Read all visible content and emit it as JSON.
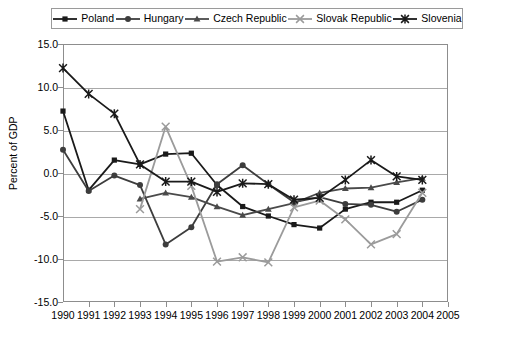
{
  "chart_data": {
    "type": "line",
    "title": "",
    "subtitle": "",
    "xlabel": "",
    "ylabel": "Percent of GDP",
    "x": [
      1990,
      1991,
      1992,
      1993,
      1994,
      1995,
      1996,
      1997,
      1998,
      1999,
      2000,
      2001,
      2002,
      2003,
      2004
    ],
    "xtick_labels": [
      "1990",
      "1991",
      "1992",
      "1993",
      "1994",
      "1995",
      "1996",
      "1997",
      "1998",
      "1999",
      "2000",
      "2001",
      "2002",
      "2003",
      "2004",
      "2005"
    ],
    "xlim": [
      1990,
      2005
    ],
    "ylim": [
      -15.0,
      15.0
    ],
    "ytick_labels": [
      "15.0",
      "10.0",
      "5.0",
      "0.0",
      "-5.0",
      "-10.0",
      "-15.0"
    ],
    "ytick_values": [
      15.0,
      10.0,
      5.0,
      0.0,
      -5.0,
      -10.0,
      -15.0
    ],
    "grid": true,
    "legend_position": "top",
    "series": [
      {
        "name": "Poland",
        "marker": "square",
        "color": "#1a1a1a",
        "values": [
          7.2,
          -2.0,
          1.5,
          1.0,
          2.2,
          2.3,
          -1.4,
          -3.9,
          -5.0,
          -6.0,
          -6.4,
          -4.2,
          -3.4,
          -3.4,
          -2.0
        ]
      },
      {
        "name": "Hungary",
        "marker": "circle",
        "color": "#3d3d3d",
        "values": [
          2.7,
          -2.1,
          -0.3,
          -1.4,
          -8.3,
          -6.3,
          -1.3,
          0.9,
          -1.3,
          -3.4,
          -2.8,
          -3.6,
          -3.7,
          -4.5,
          -3.1
        ]
      },
      {
        "name": "Czech Republic",
        "marker": "triangle",
        "color": "#4a4a4a",
        "values": [
          null,
          null,
          null,
          -3.0,
          -2.3,
          -2.8,
          -3.9,
          -4.9,
          -4.2,
          -3.5,
          -2.3,
          -1.8,
          -1.7,
          -1.1,
          -0.6
        ]
      },
      {
        "name": "Slovak Republic",
        "marker": "x",
        "color": "#9b9b9b",
        "values": [
          null,
          null,
          null,
          -4.2,
          5.4,
          -1.5,
          -10.3,
          -9.8,
          -10.4,
          -4.0,
          -3.2,
          -5.4,
          -8.3,
          -7.1,
          -2.3
        ]
      },
      {
        "name": "Slovenia",
        "marker": "star",
        "color": "#1a1a1a",
        "values": [
          12.2,
          9.2,
          6.9,
          1.0,
          -1.0,
          -1.0,
          -2.2,
          -1.2,
          -1.3,
          -3.1,
          -2.9,
          -0.8,
          1.5,
          -0.4,
          -0.8
        ]
      }
    ]
  }
}
